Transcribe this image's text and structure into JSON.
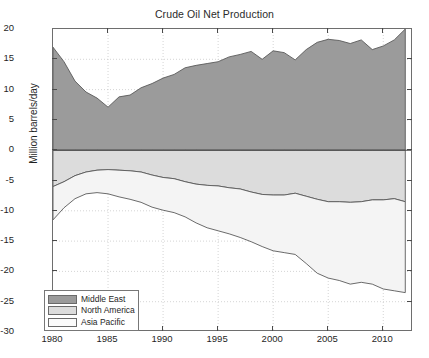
{
  "chart_data": {
    "type": "area",
    "title": "Crude Oil Net Production",
    "xlabel": "",
    "ylabel": "Million barrels/day",
    "xlim": [
      1980,
      2012.7
    ],
    "ylim": [
      -30,
      20
    ],
    "xticks": [
      1980,
      1985,
      1990,
      1995,
      2000,
      2005,
      2010
    ],
    "yticks": [
      -30,
      -25,
      -20,
      -15,
      -10,
      -5,
      0,
      5,
      10,
      15,
      20
    ],
    "grid": true,
    "stacked": true,
    "legend_position": "lower left",
    "x": [
      1980,
      1981,
      1982,
      1983,
      1984,
      1985,
      1986,
      1987,
      1988,
      1989,
      1990,
      1991,
      1992,
      1993,
      1994,
      1995,
      1996,
      1997,
      1998,
      1999,
      2000,
      2001,
      2002,
      2003,
      2004,
      2005,
      2006,
      2007,
      2008,
      2009,
      2010,
      2011,
      2012
    ],
    "series": [
      {
        "name": "Middle East",
        "color": "#9b9b9b",
        "values": [
          17.0,
          14.6,
          11.4,
          9.6,
          8.6,
          7.1,
          8.8,
          9.1,
          10.3,
          11.0,
          11.9,
          12.5,
          13.6,
          14.0,
          14.3,
          14.6,
          15.4,
          15.8,
          16.3,
          15.0,
          16.4,
          16.1,
          14.9,
          16.6,
          17.8,
          18.3,
          18.1,
          17.6,
          18.2,
          16.6,
          17.2,
          18.2,
          20.0
        ]
      },
      {
        "name": "North America",
        "color": "#dcdcdc",
        "values": [
          -6.0,
          -5.2,
          -4.2,
          -3.6,
          -3.3,
          -3.2,
          -3.3,
          -3.4,
          -3.6,
          -4.1,
          -4.5,
          -4.7,
          -5.2,
          -5.6,
          -5.8,
          -5.9,
          -6.2,
          -6.4,
          -6.9,
          -7.3,
          -7.4,
          -7.4,
          -7.1,
          -7.6,
          -8.1,
          -8.5,
          -8.5,
          -8.6,
          -8.5,
          -8.2,
          -8.2,
          -8.0,
          -8.5
        ]
      },
      {
        "name": "Asia Pacific",
        "color": "#f4f4f4",
        "values": [
          -5.5,
          -4.3,
          -3.8,
          -3.6,
          -3.7,
          -4.0,
          -4.4,
          -4.7,
          -5.0,
          -5.3,
          -5.4,
          -5.6,
          -5.8,
          -6.4,
          -7.0,
          -7.4,
          -7.6,
          -8.0,
          -8.2,
          -8.6,
          -9.2,
          -9.5,
          -10.1,
          -11.1,
          -12.2,
          -12.6,
          -13.0,
          -13.5,
          -13.3,
          -13.9,
          -14.7,
          -15.2,
          -15.0
        ]
      }
    ],
    "cumulative_lower_bounds": {
      "north_america_line": [
        -6.0,
        -5.2,
        -4.2,
        -3.6,
        -3.3,
        -3.2,
        -3.3,
        -3.4,
        -3.6,
        -4.1,
        -4.5,
        -4.7,
        -5.2,
        -5.6,
        -5.8,
        -5.9,
        -6.2,
        -6.4,
        -6.9,
        -7.3,
        -7.4,
        -7.4,
        -7.1,
        -7.6,
        -8.1,
        -8.5,
        -8.5,
        -8.6,
        -8.5,
        -8.2,
        -8.2,
        -8.0,
        -8.5
      ],
      "asia_pacific_line": [
        -11.5,
        -9.5,
        -8.0,
        -7.2,
        -7.0,
        -7.2,
        -7.7,
        -8.1,
        -8.6,
        -9.4,
        -9.9,
        -10.3,
        -11.0,
        -12.0,
        -12.8,
        -13.3,
        -13.8,
        -14.4,
        -15.1,
        -15.9,
        -16.6,
        -16.9,
        -17.2,
        -18.7,
        -20.3,
        -21.1,
        -21.5,
        -22.1,
        -21.8,
        -22.1,
        -22.9,
        -23.2,
        -23.5
      ]
    }
  },
  "legend": {
    "items": [
      {
        "label": "Middle East",
        "color": "#9b9b9b"
      },
      {
        "label": "North America",
        "color": "#dcdcdc"
      },
      {
        "label": "Asia Pacific",
        "color": "#fbfbfb"
      }
    ]
  },
  "axes": {
    "ytick_labels": [
      "20",
      "15",
      "10",
      "5",
      "0",
      "-5",
      "-10",
      "-15",
      "-20",
      "-25",
      "-30"
    ],
    "xtick_labels": [
      "1980",
      "1985",
      "1990",
      "1995",
      "2000",
      "2005",
      "2010"
    ]
  }
}
